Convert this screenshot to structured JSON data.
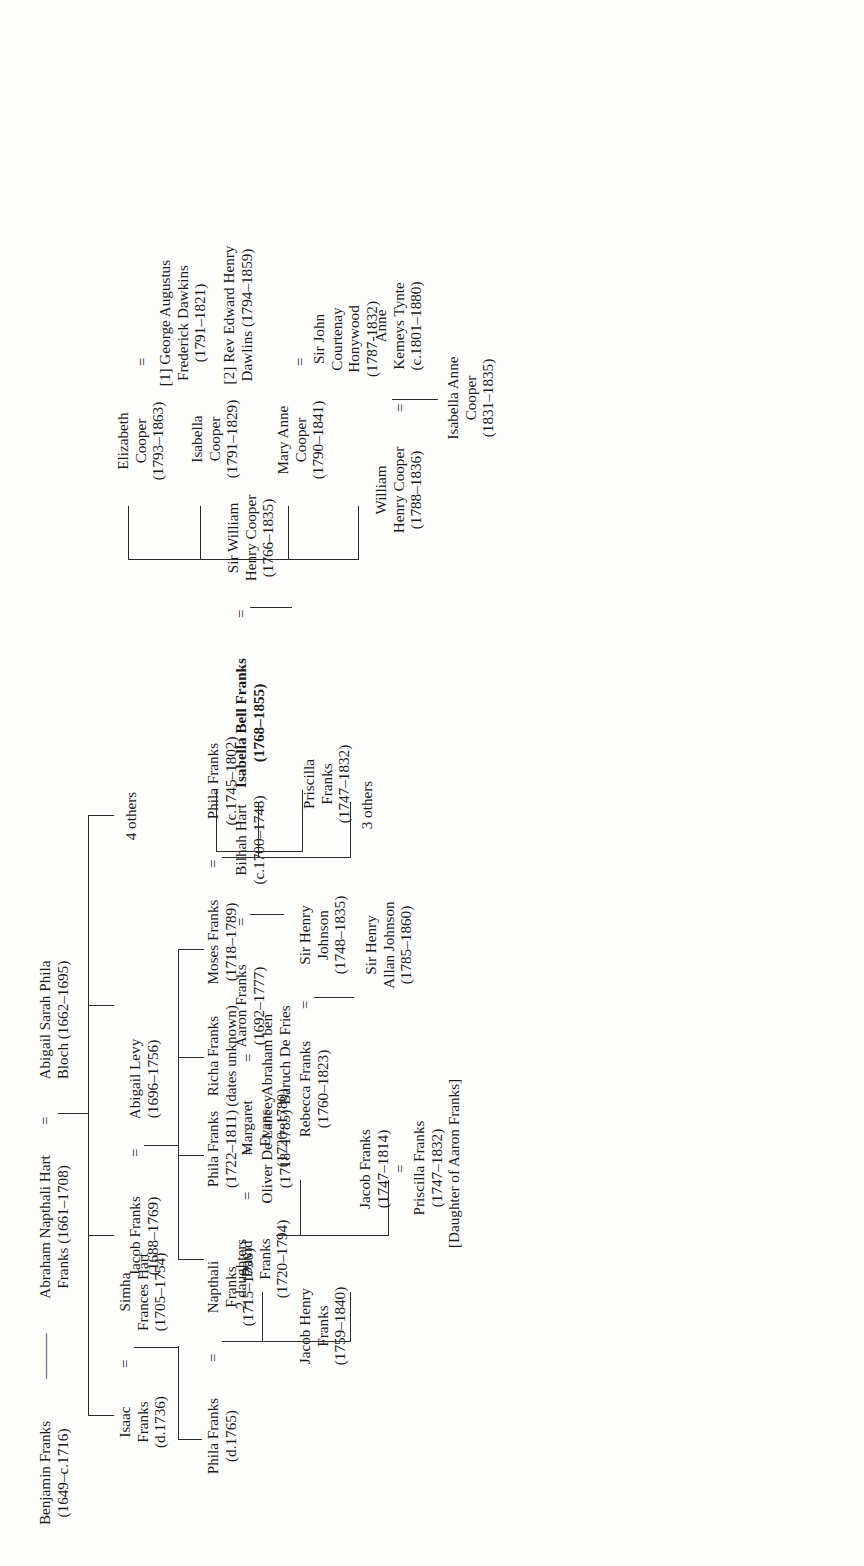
{
  "chart_title": "Franks Family Genealogical Tree",
  "orientation": "rotated-90-ccw",
  "symbols": {
    "marriage": "=",
    "descent": "———"
  },
  "people": {
    "benjamin_franks": {
      "name": "Benjamin Franks",
      "dates": "(1649–c.1716)"
    },
    "abraham_hart_franks": {
      "name": "Abraham Napthali Hart",
      "name2": "Franks (1661–1708)",
      "dates": ""
    },
    "abigail_bloch": {
      "name": "Abigail Sarah Phila",
      "name2": "Bloch (1662–1695)",
      "dates": ""
    },
    "isaac_franks": {
      "name": "Isaac",
      "name2": "Franks",
      "dates": "(d.1736)"
    },
    "simha_frances_hart": {
      "name": "Simha",
      "name2": "Frances Hart",
      "dates": "(1705–1754)"
    },
    "jacob_franks": {
      "name": "Jacob Franks",
      "dates": "(1688–1769)"
    },
    "abigail_levy": {
      "name": "Abigail Levy",
      "dates": "(1696–1756)"
    },
    "aaron_franks": {
      "name": "Aaron Franks",
      "dates": "(1692–1777)"
    },
    "bilhah_hart": {
      "name": "Bilhah Hart",
      "dates": "(c.1700–1748)"
    },
    "four_others": {
      "name": "4 others",
      "dates": ""
    },
    "phila_franks_d1765": {
      "name": "Phila Franks",
      "dates": "(d.1765)"
    },
    "napthali_franks": {
      "name": "Napthali",
      "name2": "Franks",
      "dates": "(1715–1796)"
    },
    "david_franks": {
      "name": "David",
      "name2": "Franks",
      "dates": "(1720–1794)"
    },
    "margaret_evans": {
      "name": "Margaret",
      "name2": "Evans",
      "dates": "(1720–1780)"
    },
    "phila_franks_1722": {
      "name": "Phila Franks",
      "dates": "(1722–1811)"
    },
    "oliver_de_lancey": {
      "name": "Oliver De Lancey",
      "dates": "(1718–1785)"
    },
    "richa_franks": {
      "name": "Richa Franks",
      "dates": "(dates unknown)"
    },
    "abraham_de_fries": {
      "name": "Abraham ben",
      "name2": "Baruch De Fries",
      "dates": ""
    },
    "moses_franks": {
      "name": "Moses Franks",
      "dates": "(1718–1789)"
    },
    "phila_franks_1745": {
      "name": "Phila Franks",
      "dates": "(c.1745–1802)"
    },
    "priscilla_franks_1747": {
      "name": "Priscilla",
      "name2": "Franks",
      "dates": "(1747–1832)"
    },
    "jacob_henry_franks": {
      "name": "Jacob Henry",
      "name2": "Franks",
      "dates": "(1759–1840)"
    },
    "two_daughters": {
      "name": "2 daughters",
      "dates": ""
    },
    "jacob_franks_1747": {
      "name": "Jacob Franks",
      "dates": "(1747–1814)"
    },
    "priscilla_franks_sp": {
      "name": "Priscilla Franks",
      "dates": "(1747–1832)",
      "note": "[Daughter of Aaron Franks]"
    },
    "rebecca_franks": {
      "name": "Rebecca Franks",
      "dates": "(1760–1823)"
    },
    "sir_henry_johnson": {
      "name": "Sir Henry",
      "name2": "Johnson",
      "dates": "(1748–1835)"
    },
    "sir_henry_allan_johnson": {
      "name": "Sir Henry",
      "name2": "Allan Johnson",
      "dates": "(1785–1860)"
    },
    "three_others": {
      "name": "3 others",
      "dates": ""
    },
    "isabella_bell_franks": {
      "name": "Isabella Bell Franks",
      "dates": "(1768–1855)",
      "bold": true
    },
    "sir_william_henry_cooper": {
      "name": "Sir William",
      "name2": "Henry Cooper",
      "dates": "(1766–1835)"
    },
    "william_henry_cooper": {
      "name": "William",
      "name2": "Henry Cooper",
      "dates": "(1788–1836)"
    },
    "anne_kemeys_tynte": {
      "name": "Anne",
      "name2": "Kemeys Tynte",
      "dates": "(c.1801–1880)"
    },
    "isabella_anne_cooper": {
      "name": "Isabella Anne",
      "name2": "Cooper",
      "dates": "(1831–1835)"
    },
    "mary_anne_cooper": {
      "name": "Mary Anne",
      "name2": "Cooper",
      "dates": "(1790–1841)"
    },
    "sir_john_courtenay_honywood": {
      "name": "Sir John",
      "name2": "Courtenay",
      "name3": "Honywood",
      "dates": "(1787-1832)"
    },
    "isabella_cooper": {
      "name": "Isabella",
      "name2": "Cooper",
      "dates": "(1791–1829)"
    },
    "elizabeth_cooper": {
      "name": "Elizabeth",
      "name2": "Cooper",
      "dates": "(1793–1863)"
    },
    "george_dawkins": {
      "name": "[1] George Augustus",
      "name2": "Frederick Dawkins",
      "dates": "(1791–1821)"
    },
    "edward_dawlins": {
      "name": "[2] Rev Edward Henry",
      "name2": "Dawlins (1794–1859)",
      "dates": ""
    }
  }
}
